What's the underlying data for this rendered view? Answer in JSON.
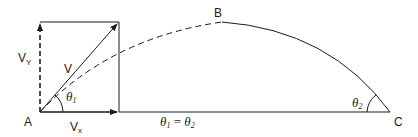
{
  "diagram": {
    "points": {
      "A": "A",
      "B": "B",
      "C": "C"
    },
    "labels": {
      "vy": "V",
      "vy_sub": "Y",
      "v": "V",
      "vx": "V",
      "vx_sub": "x",
      "theta1": "θ",
      "theta1_sub": "1",
      "theta2": "θ",
      "theta2_sub": "2",
      "equation_lhs": "θ",
      "equation_lhs_sub": "1",
      "equation_eq": " = ",
      "equation_rhs": "θ",
      "equation_rhs_sub": "2"
    },
    "colors": {
      "stroke": "#1a1a1a",
      "background": "#ffffff"
    }
  }
}
